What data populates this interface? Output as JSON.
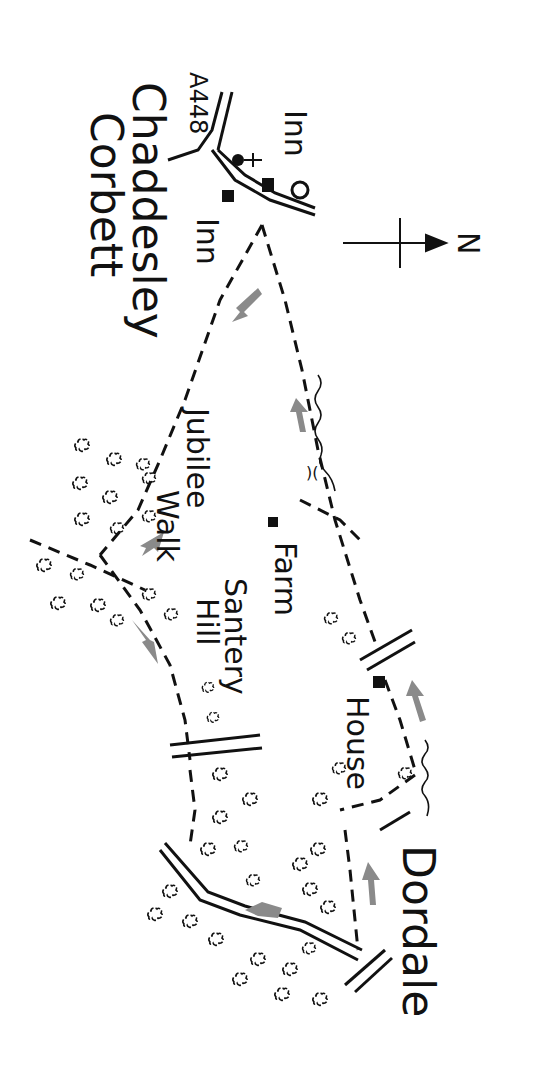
{
  "map": {
    "title": "Chaddesley Corbett walk",
    "colors": {
      "ink": "#111111",
      "arrow": "#8a8a8a",
      "paper": "#ffffff"
    },
    "compass": {
      "label": "N"
    },
    "labels": {
      "village_line1": "Chaddesley",
      "village_line2": "Corbett",
      "road": "A448",
      "inn_top": "Inn",
      "inn_bottom": "Inn",
      "jubilee": "Jubilee",
      "walk": "Walk",
      "farm": "Farm",
      "santery": "Santery",
      "hill": "Hill",
      "house": "House",
      "dordale": "Dordale"
    }
  }
}
